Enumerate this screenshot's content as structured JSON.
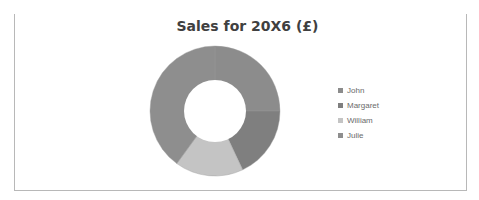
{
  "chart_data": {
    "type": "pie",
    "subtype": "doughnut",
    "title": "Sales for 20X6 (£)",
    "categories": [
      "John",
      "Margaret",
      "William",
      "Julie"
    ],
    "values": [
      25,
      18,
      17,
      40
    ],
    "values_note": "estimated shares (%) read from segment angles; no data labels shown",
    "colors": [
      "#8c8c8c",
      "#7f7f7f",
      "#c4c4c4",
      "#8e8e8e"
    ],
    "legend_position": "right",
    "start_angle": 0
  },
  "legend": {
    "items": [
      {
        "label": "John",
        "color": "#8c8c8c"
      },
      {
        "label": "Margaret",
        "color": "#7f7f7f"
      },
      {
        "label": "William",
        "color": "#c4c4c4"
      },
      {
        "label": "Julie",
        "color": "#8e8e8e"
      }
    ]
  }
}
